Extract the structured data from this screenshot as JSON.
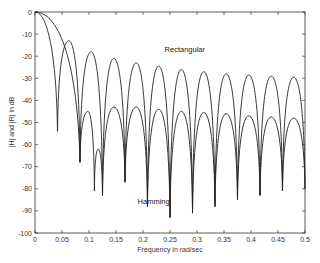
{
  "chart_data": {
    "type": "line",
    "title": "",
    "xlabel": "Frequency in rad/sec",
    "ylabel": "|H| and |R| in dB",
    "xlim": [
      0,
      0.5
    ],
    "ylim": [
      -100,
      0
    ],
    "grid": false,
    "xticks": [
      "0",
      "0.05",
      "0.1",
      "0.15",
      "0.2",
      "0.25",
      "0.3",
      "0.35",
      "0.4",
      "0.45",
      "0.5"
    ],
    "xtick_values": [
      0,
      0.05,
      0.1,
      0.15,
      0.2,
      0.25,
      0.3,
      0.35,
      0.4,
      0.45,
      0.5
    ],
    "yticks": [
      "0",
      "-10",
      "-20",
      "-30",
      "-40",
      "-50",
      "-60",
      "-70",
      "-80",
      "-90",
      "-100"
    ],
    "ytick_values": [
      0,
      -10,
      -20,
      -30,
      -40,
      -50,
      -60,
      -70,
      -80,
      -90,
      -100
    ],
    "annotations": [
      {
        "text": "Rectangular",
        "x": 0.24,
        "y": -18
      },
      {
        "text": "Hamming",
        "x": 0.19,
        "y": -87
      }
    ],
    "series": [
      {
        "name": "Rectangular",
        "points": [
          [
            0,
            0
          ],
          [
            0.0417,
            -54
          ],
          [
            0.0625,
            -13
          ],
          [
            0.0833,
            -68
          ],
          [
            0.104,
            -18
          ],
          [
            0.125,
            -83
          ],
          [
            0.146,
            -21
          ],
          [
            0.1667,
            -77
          ],
          [
            0.1875,
            -23
          ],
          [
            0.2083,
            -88
          ],
          [
            0.229,
            -24.5
          ],
          [
            0.25,
            -93
          ],
          [
            0.271,
            -26
          ],
          [
            0.2917,
            -91
          ],
          [
            0.3125,
            -27
          ],
          [
            0.3333,
            -88
          ],
          [
            0.354,
            -28
          ],
          [
            0.375,
            -85
          ],
          [
            0.396,
            -28.5
          ],
          [
            0.4167,
            -83
          ],
          [
            0.4375,
            -29
          ],
          [
            0.4583,
            -81
          ],
          [
            0.479,
            -29.5
          ],
          [
            0.5,
            -80
          ]
        ]
      },
      {
        "name": "Hamming",
        "points": [
          [
            0,
            0
          ],
          [
            0.0833,
            -68
          ],
          [
            0.098,
            -45
          ],
          [
            0.11,
            -81
          ],
          [
            0.117,
            -62
          ],
          [
            0.125,
            -83
          ],
          [
            0.146,
            -43
          ],
          [
            0.1667,
            -77
          ],
          [
            0.1875,
            -43
          ],
          [
            0.2083,
            -88
          ],
          [
            0.229,
            -44
          ],
          [
            0.25,
            -93
          ],
          [
            0.271,
            -45
          ],
          [
            0.2917,
            -91
          ],
          [
            0.3125,
            -45.5
          ],
          [
            0.3333,
            -88
          ],
          [
            0.354,
            -46
          ],
          [
            0.375,
            -85
          ],
          [
            0.396,
            -47
          ],
          [
            0.4167,
            -83
          ],
          [
            0.4375,
            -47.5
          ],
          [
            0.4583,
            -81
          ],
          [
            0.479,
            -48
          ],
          [
            0.5,
            -80
          ]
        ]
      }
    ]
  }
}
